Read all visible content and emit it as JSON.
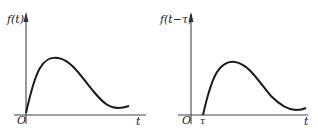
{
  "diagram": {
    "left": {
      "y_label": "f(t)",
      "x_label": "t",
      "origin_label": "O"
    },
    "right": {
      "y_label": "f(t−τ)",
      "x_label": "t",
      "origin_label": "O",
      "shift_label": "τ"
    },
    "colors": {
      "axis": "#333333",
      "curve": "#1a1a1a"
    }
  }
}
